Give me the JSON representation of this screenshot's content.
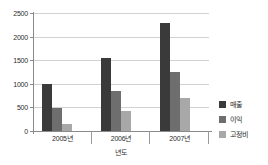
{
  "chart_data": {
    "type": "bar",
    "title": "",
    "subtitle": "",
    "xlabel": "년도",
    "ylabel": "",
    "categories": [
      "2005년",
      "2006년",
      "2007년"
    ],
    "series": [
      {
        "name": "매출",
        "color": "#3a3a3a",
        "values": [
          1000,
          1550,
          2280
        ]
      },
      {
        "name": "이익",
        "color": "#6e6e6e",
        "values": [
          490,
          850,
          1250
        ]
      },
      {
        "name": "고정비",
        "color": "#a8a8a8",
        "values": [
          150,
          430,
          700
        ]
      }
    ],
    "ylim": [
      0,
      2500
    ],
    "yticks": [
      0,
      500,
      1000,
      1500,
      2000,
      2500
    ],
    "ytick_labels": [
      "0",
      "500",
      "1000",
      "1500",
      "2000",
      "2500"
    ],
    "grid": true,
    "grid_axis": "y",
    "legend_position": "right",
    "plot_background": "#ffffff",
    "grid_color": "#d2d2d2",
    "axis_color": "#8a8a8a"
  }
}
